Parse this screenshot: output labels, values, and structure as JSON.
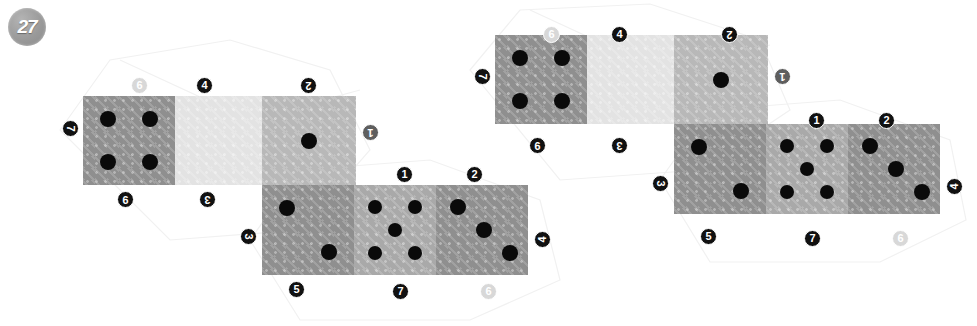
{
  "counter": {
    "value": "27"
  },
  "palette": {
    "tile_dark": "#8f8f8f",
    "tile_mid": "#a9a9a9",
    "tile_light": "#e3e3e3",
    "tile_midlight": "#b8b8b8",
    "pip": "#0a0a0a",
    "badge_dark": "#111111",
    "badge_mid": "#5e5e5e",
    "badge_light": "#d8d8d8",
    "background": "#ffffff"
  },
  "clusters": [
    {
      "name": "left-cluster",
      "x": 0,
      "y": 0,
      "tiles": [
        {
          "name": "tile-top-left",
          "x": 83,
          "y": 96,
          "w": 92,
          "h": 89,
          "shade": "tile_dark",
          "pips": 4
        },
        {
          "name": "tile-top-middle",
          "x": 175,
          "y": 96,
          "w": 87,
          "h": 89,
          "shade": "tile_light",
          "pips": 0
        },
        {
          "name": "tile-top-right",
          "x": 262,
          "y": 96,
          "w": 94,
          "h": 89,
          "shade": "tile_midlight",
          "pips": 1
        },
        {
          "name": "tile-bottom-left",
          "x": 262,
          "y": 185,
          "w": 92,
          "h": 90,
          "shade": "tile_dark",
          "pips": 2
        },
        {
          "name": "tile-bottom-middle",
          "x": 354,
          "y": 185,
          "w": 82,
          "h": 90,
          "shade": "tile_mid",
          "pips": 5
        },
        {
          "name": "tile-bottom-right",
          "x": 436,
          "y": 185,
          "w": 92,
          "h": 90,
          "shade": "tile_dark",
          "pips": 3
        }
      ],
      "labels": [
        {
          "name": "label-top-6",
          "text": "6",
          "x": 131,
          "y": 77,
          "tone": "light",
          "rot": 0
        },
        {
          "name": "label-top-4",
          "text": "4",
          "x": 196,
          "y": 77,
          "tone": "dark",
          "rot": 0
        },
        {
          "name": "label-top-2",
          "text": "2",
          "x": 300,
          "y": 77,
          "tone": "dark",
          "rot": 180
        },
        {
          "name": "label-left-7",
          "text": "7",
          "x": 62,
          "y": 120,
          "tone": "dark",
          "rot": 90
        },
        {
          "name": "label-right-1",
          "text": "1",
          "x": 362,
          "y": 124,
          "tone": "mid",
          "rot": 180
        },
        {
          "name": "label-mid-9",
          "text": "9",
          "x": 117,
          "y": 191,
          "tone": "dark",
          "rot": 180
        },
        {
          "name": "label-mid-3",
          "text": "3",
          "x": 199,
          "y": 191,
          "tone": "dark",
          "rot": 180
        },
        {
          "name": "label-row2-1",
          "text": "1",
          "x": 396,
          "y": 166,
          "tone": "dark",
          "rot": 0
        },
        {
          "name": "label-row2-2",
          "text": "2",
          "x": 466,
          "y": 166,
          "tone": "dark",
          "rot": 0
        },
        {
          "name": "label-row2-left-3",
          "text": "3",
          "x": 240,
          "y": 228,
          "tone": "dark",
          "rot": 90
        },
        {
          "name": "label-row2-right-4",
          "text": "4",
          "x": 534,
          "y": 231,
          "tone": "dark",
          "rot": -90
        },
        {
          "name": "label-row2-5",
          "text": "5",
          "x": 288,
          "y": 281,
          "tone": "dark",
          "rot": 0
        },
        {
          "name": "label-row2-7",
          "text": "7",
          "x": 392,
          "y": 283,
          "tone": "dark",
          "rot": 0
        },
        {
          "name": "label-row2-6",
          "text": "6",
          "x": 480,
          "y": 283,
          "tone": "light",
          "rot": 0
        }
      ]
    },
    {
      "name": "right-cluster",
      "x": 0,
      "y": 0,
      "tiles": [
        {
          "name": "tile-top-left",
          "x": 495,
          "y": 35,
          "w": 92,
          "h": 89,
          "shade": "tile_dark",
          "pips": 4
        },
        {
          "name": "tile-top-middle",
          "x": 587,
          "y": 35,
          "w": 87,
          "h": 89,
          "shade": "tile_light",
          "pips": 0
        },
        {
          "name": "tile-top-right",
          "x": 674,
          "y": 35,
          "w": 94,
          "h": 89,
          "shade": "tile_midlight",
          "pips": 1
        },
        {
          "name": "tile-bottom-left",
          "x": 674,
          "y": 124,
          "w": 92,
          "h": 90,
          "shade": "tile_dark",
          "pips": 2
        },
        {
          "name": "tile-bottom-middle",
          "x": 766,
          "y": 124,
          "w": 82,
          "h": 90,
          "shade": "tile_mid",
          "pips": 5
        },
        {
          "name": "tile-bottom-right",
          "x": 848,
          "y": 124,
          "w": 92,
          "h": 90,
          "shade": "tile_dark",
          "pips": 3
        }
      ],
      "labels": [
        {
          "name": "label-top-6",
          "text": "6",
          "x": 543,
          "y": 26,
          "tone": "light",
          "rot": 0
        },
        {
          "name": "label-top-4",
          "text": "4",
          "x": 611,
          "y": 26,
          "tone": "dark",
          "rot": 0
        },
        {
          "name": "label-top-2",
          "text": "2",
          "x": 721,
          "y": 26,
          "tone": "dark",
          "rot": 180
        },
        {
          "name": "label-left-7",
          "text": "7",
          "x": 474,
          "y": 68,
          "tone": "dark",
          "rot": 90
        },
        {
          "name": "label-right-1",
          "text": "1",
          "x": 774,
          "y": 68,
          "tone": "mid",
          "rot": 180
        },
        {
          "name": "label-mid-9",
          "text": "9",
          "x": 529,
          "y": 137,
          "tone": "dark",
          "rot": 180
        },
        {
          "name": "label-mid-3",
          "text": "3",
          "x": 611,
          "y": 137,
          "tone": "dark",
          "rot": 180
        },
        {
          "name": "label-row2-1",
          "text": "1",
          "x": 808,
          "y": 112,
          "tone": "dark",
          "rot": 0
        },
        {
          "name": "label-row2-2",
          "text": "2",
          "x": 878,
          "y": 112,
          "tone": "dark",
          "rot": 0
        },
        {
          "name": "label-row2-left-3",
          "text": "3",
          "x": 652,
          "y": 175,
          "tone": "dark",
          "rot": 90
        },
        {
          "name": "label-row2-right-4",
          "text": "4",
          "x": 946,
          "y": 178,
          "tone": "dark",
          "rot": -90
        },
        {
          "name": "label-row2-5",
          "text": "5",
          "x": 700,
          "y": 228,
          "tone": "dark",
          "rot": 0
        },
        {
          "name": "label-row2-7",
          "text": "7",
          "x": 804,
          "y": 230,
          "tone": "dark",
          "rot": 0
        },
        {
          "name": "label-row2-6",
          "text": "6",
          "x": 892,
          "y": 230,
          "tone": "light",
          "rot": 0
        }
      ]
    }
  ]
}
